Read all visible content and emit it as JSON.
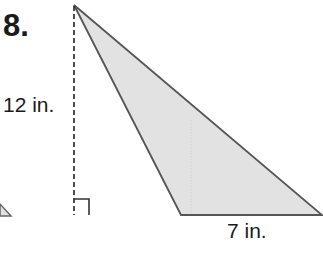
{
  "problem": {
    "number": "8.",
    "height_label": "12 in.",
    "base_label": "7 in."
  },
  "figure": {
    "shape": "obtuse triangle with external altitude",
    "height_value": 12,
    "base_value": 7,
    "unit": "in.",
    "fill_color": "#e2e2e2",
    "stroke_color": "#555555",
    "dash_color": "#222222"
  }
}
